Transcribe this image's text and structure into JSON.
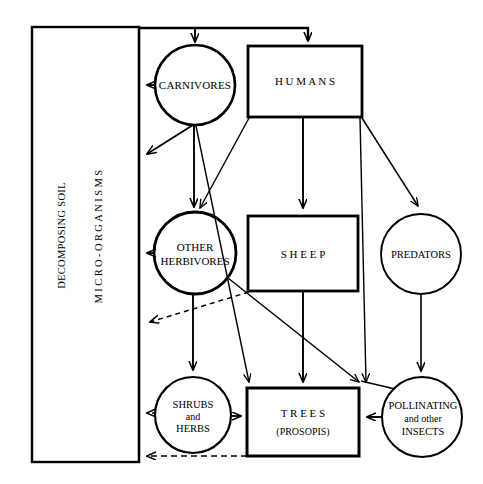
{
  "diagram": {
    "type": "food-web",
    "stroke_color": "#000000",
    "background_color": "#ffffff"
  },
  "nodes": {
    "decomposers": {
      "shape": "rectangle",
      "line1": "DECOMPOSING SOIL",
      "line2": "MICRO-ORGANISMS"
    },
    "carnivores": {
      "shape": "circle",
      "label": "CARNIVORES"
    },
    "humans": {
      "shape": "rectangle",
      "label": "H U M A N S"
    },
    "other_herbivores": {
      "shape": "circle",
      "line1": "OTHER",
      "line2": "HERBIVORES"
    },
    "sheep": {
      "shape": "rectangle",
      "label": "S H E E P"
    },
    "predators": {
      "shape": "circle",
      "label": "PREDATORS"
    },
    "shrubs_herbs": {
      "shape": "circle",
      "line1": "SHRUBS",
      "line2": "and",
      "line3": "HERBS"
    },
    "trees": {
      "shape": "rectangle",
      "line1": "T R E E S",
      "line2": "(PROSOPIS)"
    },
    "pollinators": {
      "shape": "circle",
      "line1": "POLLINATING",
      "line2": "and other",
      "line3": "INSECTS"
    }
  },
  "edges": [
    {
      "from": "decomposers",
      "to": "carnivores",
      "style": "solid"
    },
    {
      "from": "decomposers",
      "to": "humans",
      "style": "solid"
    },
    {
      "from": "carnivores",
      "to": "decomposers",
      "style": "solid"
    },
    {
      "from": "carnivores",
      "to": "decomposers",
      "style": "solid"
    },
    {
      "from": "carnivores",
      "to": "other_herbivores",
      "style": "solid"
    },
    {
      "from": "carnivores",
      "to": "trees",
      "style": "solid"
    },
    {
      "from": "humans",
      "to": "other_herbivores",
      "style": "solid"
    },
    {
      "from": "humans",
      "to": "sheep",
      "style": "solid"
    },
    {
      "from": "humans",
      "to": "trees",
      "style": "solid"
    },
    {
      "from": "humans",
      "to": "predators",
      "style": "solid"
    },
    {
      "from": "other_herbivores",
      "to": "decomposers",
      "style": "solid"
    },
    {
      "from": "other_herbivores",
      "to": "shrubs_herbs",
      "style": "solid"
    },
    {
      "from": "other_herbivores",
      "to": "trees",
      "style": "solid"
    },
    {
      "from": "sheep",
      "to": "decomposers",
      "style": "dashed"
    },
    {
      "from": "sheep",
      "to": "trees",
      "style": "solid"
    },
    {
      "from": "predators",
      "to": "pollinators",
      "style": "solid"
    },
    {
      "from": "shrubs_herbs",
      "to": "decomposers",
      "style": "dashed"
    },
    {
      "from": "shrubs_herbs",
      "to": "trees",
      "style": "solid"
    },
    {
      "from": "trees",
      "to": "decomposers",
      "style": "dashed"
    },
    {
      "from": "pollinators",
      "to": "trees",
      "style": "solid"
    }
  ]
}
